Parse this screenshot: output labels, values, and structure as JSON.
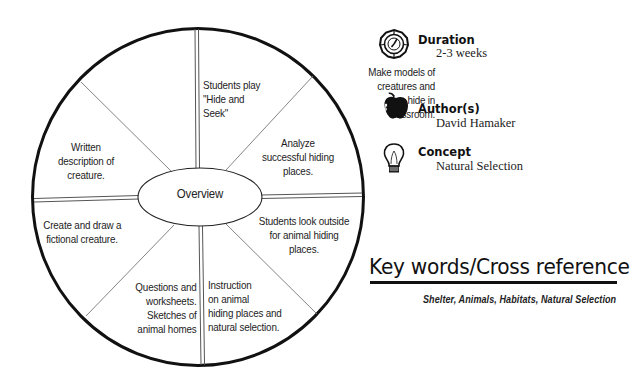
{
  "overview": {
    "hub_label": "Overview",
    "segments": [
      {
        "id": "top-left",
        "text": "Make models of\ncreatures and\nhide in\nclassroom."
      },
      {
        "id": "top-right",
        "text": "Students play\n\"Hide and\nSeek\""
      },
      {
        "id": "right-upper",
        "text": "Analyze\nsuccessful hiding\nplaces."
      },
      {
        "id": "right-lower",
        "text": "Students look outside\nfor animal hiding\nplaces."
      },
      {
        "id": "bottom-right",
        "text": "Instruction\non animal\nhiding places and\nnatural selection."
      },
      {
        "id": "bottom-left",
        "text": "Questions and\nworksheets.\nSketches of\nanimal homes"
      },
      {
        "id": "left-lower",
        "text": "Create and draw a\nfictional creature."
      },
      {
        "id": "left-upper",
        "text": "Written\ndescription of\ncreature."
      }
    ]
  },
  "info": {
    "duration": {
      "icon": "clock-icon",
      "title": "Duration",
      "value": "2-3 weeks"
    },
    "authors": {
      "icon": "apple-icon",
      "title": "Author(s)",
      "value": "David Hamaker"
    },
    "concept": {
      "icon": "lightbulb-icon",
      "title": "Concept",
      "value": "Natural Selection"
    }
  },
  "keywords": {
    "heading": "Key words/Cross reference",
    "list": "Shelter, Animals, Habitats, Natural Selection"
  },
  "colors": {
    "ink": "#111111",
    "background": "#ffffff",
    "divider_gray": "#777777"
  }
}
